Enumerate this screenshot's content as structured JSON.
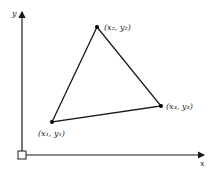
{
  "diagram": {
    "axes": {
      "x_label": "x",
      "y_label": "y",
      "origin_marker": "square"
    },
    "vertices": [
      {
        "label": "(x₁, y₁)",
        "px": 52,
        "py": 122
      },
      {
        "label": "(x₂, y₂)",
        "px": 97,
        "py": 27
      },
      {
        "label": "(x₃, y₃)",
        "px": 161,
        "py": 106
      }
    ],
    "colors": {
      "line": "#1a1a1a",
      "background": "#ffffff"
    }
  }
}
